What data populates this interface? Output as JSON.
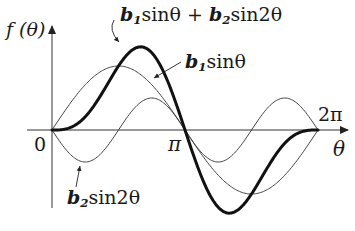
{
  "diagram": {
    "y_axis_label": "f (θ)",
    "x_axis_label": "θ",
    "ticks": {
      "origin": "0",
      "pi": "π",
      "two_pi": "2π"
    },
    "curves": [
      {
        "id": "sum",
        "label_coef1": "b",
        "label_sub1": "1",
        "label_mid": "sinθ + ",
        "label_coef2": "b",
        "label_sub2": "2",
        "label_end": "sin2θ",
        "stroke": "#111111",
        "width": 3
      },
      {
        "id": "fundamental",
        "label_coef": "b",
        "label_sub": "1",
        "label_end": "sinθ",
        "stroke": "#444444",
        "width": 1
      },
      {
        "id": "harmonic",
        "label_coef": "b",
        "label_sub": "2",
        "label_end": "sin2θ",
        "stroke": "#444444",
        "width": 1
      }
    ],
    "colors": {
      "axis": "#333333",
      "thin_curve": "#444444",
      "thick_curve": "#111111",
      "background": "#ffffff"
    }
  },
  "chart_data": {
    "type": "line",
    "title": "",
    "xlabel": "θ",
    "ylabel": "f (θ)",
    "x_ticks": [
      "0",
      "π",
      "2π"
    ],
    "xlim": [
      0,
      6.283
    ],
    "series": [
      {
        "name": "b1 sinθ",
        "expr": "b1*sin(θ)",
        "relative_amplitude": 1.0
      },
      {
        "name": "b2 sin2θ",
        "expr": "b2*sin(2θ)",
        "relative_amplitude": 0.5,
        "note": "negative coefficient (starts downward)"
      },
      {
        "name": "b1 sinθ + b2 sin2θ",
        "expr": "b1*sin(θ)+b2*sin(2θ)",
        "emphasis": "bold"
      }
    ],
    "grid": false,
    "legend": "inline annotations with arrows"
  }
}
